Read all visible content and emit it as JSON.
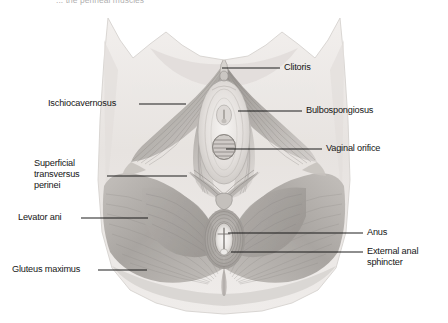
{
  "figure": {
    "title_partial": "... the perineal muscles",
    "type": "anatomical-illustration",
    "view": "lithotomy / inferior view",
    "style": "grayscale pencil-shaded medical illustration",
    "palette": {
      "page_background": "#ffffff",
      "skin_light": "#ece9e6",
      "skin_mid": "#dcd8d4",
      "muscle_light": "#cfcbc7",
      "muscle_mid": "#aaa6a2",
      "muscle_dark": "#8b8782",
      "outline": "#6e6a66",
      "leader_line": "#121212",
      "label_text": "#161616"
    }
  },
  "labels": {
    "left": [
      {
        "id": "ischiocavernosus",
        "text": "Ischiocavernosus",
        "text_x": 48,
        "text_y": 98,
        "line_x1": 139,
        "line_y1": 104,
        "line_x2": 186,
        "line_y2": 104
      },
      {
        "id": "superficial-transversus-perinei",
        "text": "Superficial\ntransversus\nperinei",
        "text_x": 34,
        "text_y": 158,
        "line_x1": 107,
        "line_y1": 176,
        "line_x2": 187,
        "line_y2": 176
      },
      {
        "id": "levator-ani",
        "text": "Levator ani",
        "text_x": 18,
        "text_y": 212,
        "line_x1": 81,
        "line_y1": 218,
        "line_x2": 148,
        "line_y2": 218
      },
      {
        "id": "gluteus-maximus",
        "text": "Gluteus maximus",
        "text_x": 12,
        "text_y": 264,
        "line_x1": 98,
        "line_y1": 270,
        "line_x2": 147,
        "line_y2": 270
      }
    ],
    "right": [
      {
        "id": "clitoris",
        "text": "Clitoris",
        "text_x": 284,
        "text_y": 62,
        "line_x1": 222,
        "line_y1": 68,
        "line_x2": 280,
        "line_y2": 68
      },
      {
        "id": "bulbospongiosus",
        "text": "Bulbospongiosus",
        "text_x": 306,
        "text_y": 105,
        "line_x1": 238,
        "line_y1": 111,
        "line_x2": 302,
        "line_y2": 111
      },
      {
        "id": "vaginal-orifice",
        "text": "Vaginal orifice",
        "text_x": 326,
        "text_y": 143,
        "line_x1": 226,
        "line_y1": 149,
        "line_x2": 322,
        "line_y2": 149
      },
      {
        "id": "anus",
        "text": "Anus",
        "text_x": 367,
        "text_y": 227,
        "line_x1": 228,
        "line_y1": 233,
        "line_x2": 363,
        "line_y2": 233
      },
      {
        "id": "external-anal-sphincter",
        "text": "External anal\nsphincter",
        "text_x": 367,
        "text_y": 246,
        "line_x1": 231,
        "line_y1": 252,
        "line_x2": 363,
        "line_y2": 252
      }
    ]
  }
}
